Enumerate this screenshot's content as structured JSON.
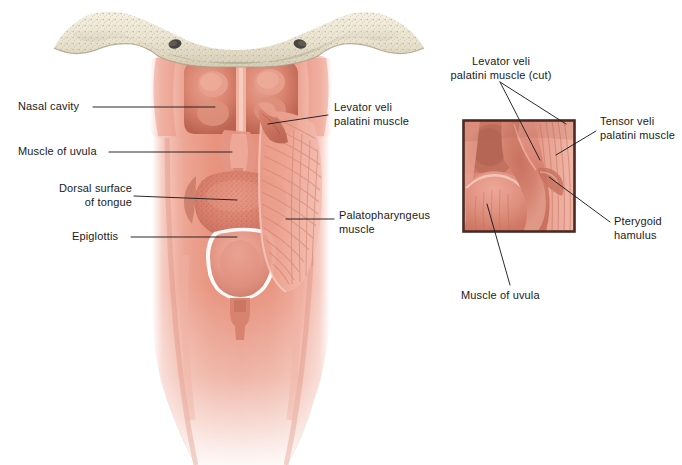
{
  "figure": {
    "background_color": "#ffffff",
    "width": 682,
    "height": 465
  },
  "palette": {
    "bone_light": "#efe9d8",
    "bone_shadow": "#cfc7b0",
    "bone_speckle": "#bdb49a",
    "mucosa_light": "#f3b3a6",
    "mucosa_mid": "#e8907f",
    "mucosa_deep": "#d2705f",
    "mucosa_dark": "#b85a4c",
    "muscle_stripe": "#e59a8a",
    "inset_border": "#4a2a22",
    "leader_line": "#1f1f1f",
    "text": "#1a1a1a"
  },
  "main_illustration": {
    "name": "posterior-pharynx-dissection",
    "parts": [
      "sphenoid-bone-base",
      "nasal-choanae",
      "soft-palate",
      "uvula",
      "dorsal-tongue",
      "epiglottis",
      "pharyngeal-wall",
      "palatopharyngeus-fibers",
      "esophagus"
    ]
  },
  "inset": {
    "name": "magnified-detail-box",
    "border_color": "#4a2a22",
    "x": 463,
    "y": 120,
    "width": 112,
    "height": 112
  },
  "labels": [
    {
      "id": "nasal-cavity",
      "text": "Nasal cavity",
      "align": "left",
      "x": 18,
      "y": 100,
      "leader": [
        [
          93,
          107
        ],
        [
          215,
          107
        ]
      ]
    },
    {
      "id": "muscle-of-uvula-left",
      "text": "Muscle of uvula",
      "align": "left",
      "x": 18,
      "y": 145,
      "leader": [
        [
          109,
          152
        ],
        [
          232,
          152
        ]
      ]
    },
    {
      "id": "dorsal-surface-of-tongue",
      "text": "Dorsal surface\nof tongue",
      "align": "right",
      "x": 36,
      "y": 182,
      "leader": [
        [
          134,
          196
        ],
        [
          237,
          200
        ]
      ]
    },
    {
      "id": "epiglottis",
      "text": "Epiglottis",
      "align": "left",
      "x": 72,
      "y": 230,
      "leader": [
        [
          131,
          237
        ],
        [
          237,
          237
        ]
      ]
    },
    {
      "id": "levator-veli-palatini-muscle",
      "text": "Levator veli\npalatini muscle",
      "align": "left",
      "x": 332,
      "y": 101,
      "leader": [
        [
          328,
          115
        ],
        [
          268,
          124
        ]
      ]
    },
    {
      "id": "palatopharyngeus-muscle",
      "text": "Palatopharyngeus\nmuscle",
      "align": "left",
      "x": 339,
      "y": 209,
      "leader": [
        [
          334,
          219
        ],
        [
          286,
          219
        ]
      ]
    },
    {
      "id": "levator-veli-palatini-muscle-cut",
      "text": "Levator veli\npalatini muscle (cut)",
      "align": "center",
      "x": 440,
      "y": 55,
      "leader": [
        [
          500,
          82
        ],
        [
          566,
          124
        ]
      ],
      "leader2": [
        [
          500,
          82
        ],
        [
          540,
          160
        ]
      ]
    },
    {
      "id": "tensor-veli-palatini-muscle",
      "text": "Tensor veli\npalatini muscle",
      "align": "left",
      "x": 600,
      "y": 115,
      "leader": [
        [
          596,
          131
        ],
        [
          556,
          155
        ]
      ]
    },
    {
      "id": "pterygoid-hamulus",
      "text": "Pterygoid\nhamulus",
      "align": "left",
      "x": 614,
      "y": 215,
      "leader": [
        [
          610,
          222
        ],
        [
          549,
          177
        ]
      ]
    },
    {
      "id": "muscle-of-uvula-inset",
      "text": "Muscle of uvula",
      "align": "left",
      "x": 461,
      "y": 289,
      "leader": [
        [
          510,
          285
        ],
        [
          487,
          204
        ]
      ]
    }
  ]
}
